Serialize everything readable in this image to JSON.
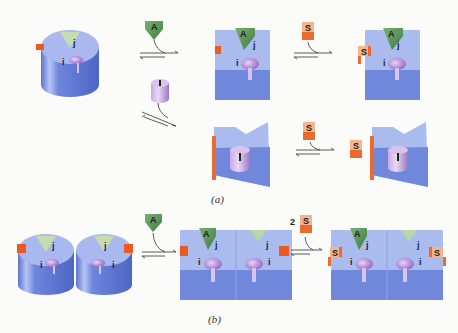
{
  "figure": {
    "panel_a": {
      "caption": "(a)",
      "enzyme_free": {
        "site_labels": [
          "j",
          "i"
        ]
      },
      "activator_label": "A",
      "inhibitor_label": "I",
      "substrate_label": "S",
      "states": [
        {
          "name": "free-enzyme",
          "sites": [
            "j",
            "i"
          ]
        },
        {
          "name": "activator-bound",
          "ligand": "A",
          "sites": [
            "j",
            "i"
          ]
        },
        {
          "name": "activator-substrate-bound",
          "ligands": [
            "A",
            "S"
          ],
          "sites": [
            "j",
            "i"
          ]
        },
        {
          "name": "inhibitor-bound",
          "ligand": "I"
        },
        {
          "name": "inhibitor-substrate-bound",
          "ligands": [
            "I",
            "S"
          ]
        }
      ]
    },
    "panel_b": {
      "caption": "(b)",
      "substrate_stoichiometry": "2",
      "activator_label": "A",
      "substrate_label": "S",
      "site_labels": [
        "j",
        "i"
      ]
    },
    "colors": {
      "enzyme_top": "#a9b9ef",
      "enzyme_side": "#6f86dc",
      "activator": "#5f9a5c",
      "activator_light": "#b9d6a4",
      "substrate_top": "#f6b48a",
      "substrate_side": "#ec6a2c",
      "inhibitor": "#b99ad8",
      "background": "#fbfbfa"
    }
  }
}
